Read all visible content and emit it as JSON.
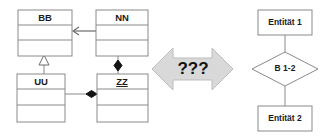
{
  "figure": {
    "background_color": "#ffffff",
    "line_color": "#8a8a8a"
  },
  "uml_diagram": {
    "name": "uml-class-diagram",
    "classes": [
      {
        "id": "bb",
        "name": "BB",
        "underlined": false,
        "x": 18,
        "y": 10,
        "w": 54,
        "h": 46
      },
      {
        "id": "nn",
        "name": "NN",
        "underlined": false,
        "x": 96,
        "y": 10,
        "w": 52,
        "h": 46
      },
      {
        "id": "uu",
        "name": "UU",
        "underlined": false,
        "x": 17,
        "y": 74,
        "w": 48,
        "h": 48
      },
      {
        "id": "zz",
        "name": "ZZ",
        "underlined": true,
        "x": 97,
        "y": 74,
        "w": 51,
        "h": 48
      }
    ],
    "relations": [
      {
        "id": "nn-to-bb",
        "type": "association-arrow",
        "from": "nn",
        "to": "bb",
        "marker": "open-arrowhead"
      },
      {
        "id": "uu-to-bb",
        "type": "generalization",
        "from": "uu",
        "to": "bb",
        "marker": "hollow-triangle"
      },
      {
        "id": "nn-to-zz",
        "type": "composition",
        "from": "nn",
        "to": "zz",
        "marker": "filled-diamond"
      },
      {
        "id": "uu-to-zz",
        "type": "composition",
        "from": "uu",
        "to": "zz",
        "marker": "filled-diamond"
      }
    ]
  },
  "transform_arrow": {
    "name": "double-headed-arrow",
    "label": "???",
    "fill_color": "#d9d9d9",
    "border_color": "#bdbdbd"
  },
  "er_diagram": {
    "name": "entity-relationship-diagram",
    "entities": [
      {
        "id": "entitaet1",
        "label": "Entität 1",
        "x": 258,
        "y": 10,
        "w": 54,
        "h": 25
      },
      {
        "id": "entitaet2",
        "label": "Entität 2",
        "x": 258,
        "y": 106,
        "w": 54,
        "h": 25
      }
    ],
    "relationship": {
      "id": "b12",
      "label": "B 1-2",
      "cx": 285,
      "cy": 69,
      "rx": 33,
      "ry": 17
    },
    "connectors": [
      {
        "id": "e1-to-b12",
        "from": "entitaet1",
        "to": "b12"
      },
      {
        "id": "b12-to-e2",
        "from": "b12",
        "to": "entitaet2"
      }
    ]
  }
}
